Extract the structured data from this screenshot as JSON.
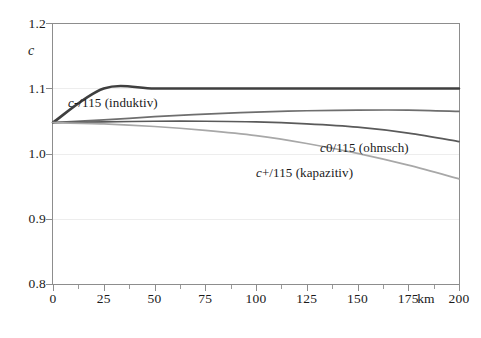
{
  "chart_data": {
    "type": "line",
    "title": "",
    "xlabel": "km",
    "ylabel": "c",
    "xlim": [
      0,
      200
    ],
    "ylim": [
      0.8,
      1.2
    ],
    "grid": true,
    "legend_position": "inline-annotations",
    "x_ticks": [
      0,
      25,
      50,
      75,
      100,
      125,
      150,
      175,
      200
    ],
    "x_minor_ticks": [
      12.5,
      37.5,
      62.5,
      87.5,
      112.5,
      137.5,
      162.5,
      187.5
    ],
    "y_ticks": [
      0.8,
      0.9,
      1.0,
      1.1,
      1.2
    ],
    "x": [
      0,
      25,
      50,
      75,
      100,
      125,
      150,
      175,
      200
    ],
    "series": [
      {
        "name": "c/115 (Referenz)",
        "color": "#3f3f3f",
        "width": 2.6,
        "values": [
          1.048,
          1.1,
          1.1,
          1.1,
          1.1,
          1.1,
          1.1,
          1.1,
          1.1
        ]
      },
      {
        "name": "c-/115 (induktiv)",
        "color": "#6e6e6e",
        "width": 1.7,
        "values": [
          1.048,
          1.052,
          1.057,
          1.061,
          1.064,
          1.066,
          1.067,
          1.067,
          1.065
        ]
      },
      {
        "name": "c0/115 (ohmsch)",
        "color": "#5a5a5a",
        "width": 1.7,
        "values": [
          1.048,
          1.049,
          1.05,
          1.05,
          1.049,
          1.046,
          1.041,
          1.032,
          1.019
        ]
      },
      {
        "name": "c+/115 (kapazitiv)",
        "color": "#a8a8a8",
        "width": 1.7,
        "values": [
          1.048,
          1.046,
          1.042,
          1.036,
          1.028,
          1.016,
          1.001,
          0.983,
          0.962
        ]
      }
    ],
    "annotations": [
      {
        "text": "c-/115 (induktiv)",
        "prefix": "c",
        "rest": "-/115 (induktiv)",
        "x_px": 68,
        "y_px": 97
      },
      {
        "text": "c0/115 (ohmsch)",
        "prefix": "c",
        "rest": "0/115 (ohmsch)",
        "x_px": 320,
        "y_px": 142
      },
      {
        "text": "c+/115 (kapazitiv)",
        "prefix": "c",
        "rest": "+/115 (kapazitiv)",
        "x_px": 256,
        "y_px": 167
      }
    ]
  },
  "axes": {
    "y_axis_title": "c",
    "y_tick_labels": [
      "1.2",
      "1.1",
      "1.0",
      "0.9",
      "0.8"
    ],
    "x_tick_labels": [
      "0",
      "25",
      "50",
      "75",
      "100",
      "125",
      "150",
      "175",
      "200"
    ],
    "x_unit_label": "km"
  },
  "colors": {
    "frame": "#8d8d8d",
    "grid": "#ededed",
    "text": "#1a1a1a",
    "series_ref": "#3f3f3f",
    "series_induktiv": "#6e6e6e",
    "series_ohmsch": "#5a5a5a",
    "series_kapazitiv": "#a8a8a8"
  }
}
